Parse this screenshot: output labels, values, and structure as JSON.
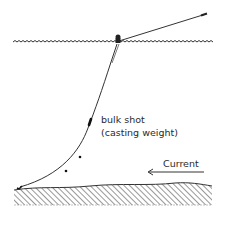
{
  "diagram": {
    "type": "fishing-rig-illustration",
    "labels": {
      "bulk_shot": "bulk shot",
      "bulk_shot_note": "(casting weight)",
      "current": "Current"
    },
    "elements": {
      "water_surface": "wavy water surface line",
      "rod_line": "line from float to rod tip (upper right)",
      "float": "float on surface",
      "main_line": "curved line from float to seabed",
      "bulk_shot_marker": "elongated weight on line",
      "small_shots": 2,
      "hook": "hook resting on seabed",
      "seabed": "hatched bottom",
      "current_arrow_direction": "left"
    },
    "colors": {
      "ink": "#2a2a2a",
      "background": "#ffffff"
    }
  }
}
